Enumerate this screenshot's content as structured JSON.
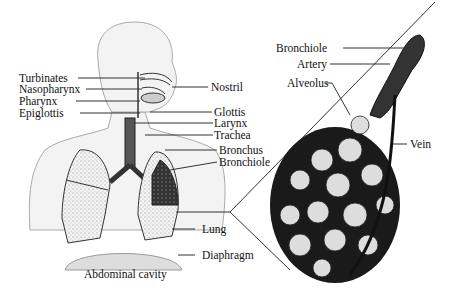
{
  "figure": {
    "left_labels": {
      "turbinates": "Turbinates",
      "nasopharynx": "Nasopharynx",
      "pharynx": "Pharynx",
      "epiglottis": "Epiglottis"
    },
    "right_labels": {
      "nostril": "Nostril",
      "glottis": "Glottis",
      "larynx": "Larynx",
      "trachea": "Trachea",
      "bronchus": "Bronchus",
      "bronchiole": "Bronchiole",
      "lung": "Lung",
      "diaphragm": "Diaphragm"
    },
    "bottom_label": "Abdominal cavity",
    "detail_labels": {
      "bronchiole": "Bronchiole",
      "artery": "Artery",
      "alveolus": "Alveolus",
      "vein": "Vein"
    }
  }
}
